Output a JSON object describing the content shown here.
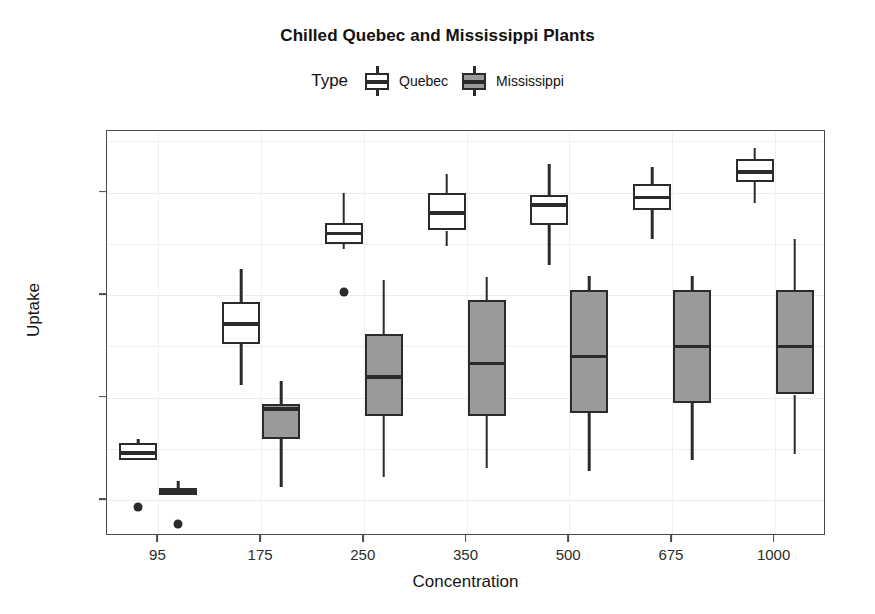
{
  "chart_data": {
    "type": "box",
    "title": "Chilled Quebec and Mississippi Plants",
    "xlabel": "Concentration",
    "ylabel": "Uptake",
    "categories": [
      "95",
      "175",
      "250",
      "350",
      "500",
      "675",
      "1000"
    ],
    "ylim": [
      6.5,
      46.0
    ],
    "yticks": [
      10,
      20,
      30,
      40
    ],
    "ytick_labels": [
      "10",
      "20",
      "30",
      "40"
    ],
    "grid": true,
    "legend": {
      "title": "Type",
      "position": "top",
      "entries": [
        {
          "name": "Quebec",
          "fill": "#ffffff",
          "stroke": "#2b2b2b"
        },
        {
          "name": "Mississippi",
          "fill": "#9a9a9a",
          "stroke": "#2b2b2b"
        }
      ]
    },
    "series": [
      {
        "name": "Quebec",
        "fill": "#ffffff",
        "boxes": [
          {
            "category": "95",
            "whisker_low": 14.2,
            "q1": 13.9,
            "median": 14.6,
            "q3": 15.6,
            "whisker_high": 16.0,
            "outliers": [
              9.3
            ]
          },
          {
            "category": "175",
            "whisker_low": 21.2,
            "q1": 25.2,
            "median": 27.2,
            "q3": 29.3,
            "whisker_high": 32.5,
            "outliers": []
          },
          {
            "category": "250",
            "whisker_low": 34.5,
            "q1": 35.0,
            "median": 36.0,
            "q3": 37.0,
            "whisker_high": 40.0,
            "outliers": [
              30.3
            ]
          },
          {
            "category": "350",
            "whisker_low": 34.8,
            "q1": 36.3,
            "median": 38.0,
            "q3": 40.0,
            "whisker_high": 41.8,
            "outliers": []
          },
          {
            "category": "500",
            "whisker_low": 32.9,
            "q1": 36.8,
            "median": 38.8,
            "q3": 39.8,
            "whisker_high": 42.8,
            "outliers": []
          },
          {
            "category": "675",
            "whisker_low": 35.5,
            "q1": 38.3,
            "median": 39.5,
            "q3": 40.8,
            "whisker_high": 42.5,
            "outliers": []
          },
          {
            "category": "1000",
            "whisker_low": 39.0,
            "q1": 41.0,
            "median": 42.0,
            "q3": 43.3,
            "whisker_high": 44.3,
            "outliers": []
          }
        ]
      },
      {
        "name": "Mississippi",
        "fill": "#9a9a9a",
        "boxes": [
          {
            "category": "95",
            "whisker_low": 10.5,
            "q1": 10.5,
            "median": 10.9,
            "q3": 11.2,
            "whisker_high": 11.9,
            "outliers": [
              7.7
            ]
          },
          {
            "category": "175",
            "whisker_low": 11.3,
            "q1": 16.0,
            "median": 18.9,
            "q3": 19.4,
            "whisker_high": 21.6,
            "outliers": []
          },
          {
            "category": "250",
            "whisker_low": 12.3,
            "q1": 18.2,
            "median": 22.0,
            "q3": 26.2,
            "whisker_high": 31.5,
            "outliers": []
          },
          {
            "category": "350",
            "whisker_low": 13.1,
            "q1": 18.2,
            "median": 23.3,
            "q3": 29.5,
            "whisker_high": 31.8,
            "outliers": []
          },
          {
            "category": "500",
            "whisker_low": 12.8,
            "q1": 18.5,
            "median": 24.0,
            "q3": 30.5,
            "whisker_high": 31.9,
            "outliers": []
          },
          {
            "category": "675",
            "whisker_low": 13.9,
            "q1": 19.5,
            "median": 25.0,
            "q3": 30.5,
            "whisker_high": 31.9,
            "outliers": []
          },
          {
            "category": "1000",
            "whisker_low": 14.5,
            "q1": 20.3,
            "median": 25.0,
            "q3": 30.5,
            "whisker_high": 35.5,
            "outliers": []
          }
        ]
      }
    ]
  }
}
